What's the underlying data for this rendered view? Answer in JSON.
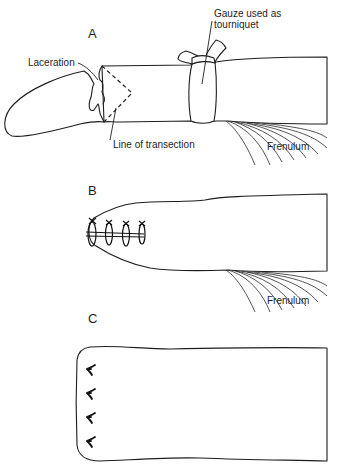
{
  "figure": {
    "panels": [
      {
        "id": "A",
        "label": "A",
        "callouts": {
          "gauze_line1": "Gauze used as",
          "gauze_line2": "tourniquet",
          "laceration": "Laceration",
          "transection": "Line of transection",
          "frenulum": "Frenulum"
        }
      },
      {
        "id": "B",
        "label": "B",
        "callouts": {
          "frenulum": "Frenulum"
        },
        "suture_count": 4
      },
      {
        "id": "C",
        "label": "C",
        "suture_count": 4
      }
    ],
    "colors": {
      "line": "#1e1e1e",
      "background": "#ffffff"
    }
  }
}
